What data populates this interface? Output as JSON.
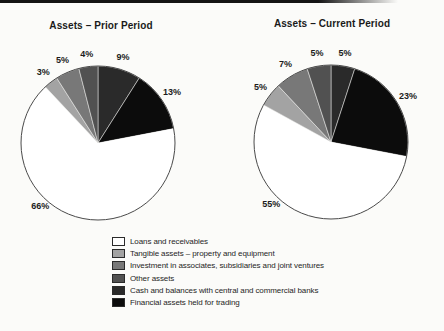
{
  "page": {
    "background": "#fbfbf9",
    "top_rule_color": "#141414"
  },
  "colors": {
    "loans": "#ffffff",
    "tangible": "#a3a3a3",
    "investment": "#787878",
    "other": "#515151",
    "cash": "#2a2a2a",
    "financial": "#0c0c0c",
    "outline": "#4a4a4a",
    "label_text": "#1c1c1c"
  },
  "legend": {
    "items": [
      {
        "key": "loans",
        "label": "Loans and receivables"
      },
      {
        "key": "tangible",
        "label": "Tangible assets – property and equipment"
      },
      {
        "key": "investment",
        "label": "Investment in associates, subsidiaries and joint ventures"
      },
      {
        "key": "other",
        "label": "Other assets"
      },
      {
        "key": "cash",
        "label": "Cash and balances with central and commercial banks"
      },
      {
        "key": "financial",
        "label": "Financial assets held for trading"
      }
    ]
  },
  "chart_data": [
    {
      "type": "pie",
      "title": "Assets – Prior Period",
      "unit": "%",
      "start_angle_deg": 0,
      "direction": "clockwise",
      "legend_position": "bottom-shared",
      "slices": [
        {
          "key": "cash",
          "label": "Cash and balances with central and commercial banks",
          "value": 9
        },
        {
          "key": "financial",
          "label": "Financial assets held for trading",
          "value": 13
        },
        {
          "key": "loans",
          "label": "Loans and receivables",
          "value": 66
        },
        {
          "key": "tangible",
          "label": "Tangible assets – property and equipment",
          "value": 3
        },
        {
          "key": "investment",
          "label": "Investment in associates, subsidiaries and joint ventures",
          "value": 5
        },
        {
          "key": "other",
          "label": "Other assets",
          "value": 4
        }
      ]
    },
    {
      "type": "pie",
      "title": "Assets – Current Period",
      "unit": "%",
      "start_angle_deg": 0,
      "direction": "clockwise",
      "legend_position": "bottom-shared",
      "slices": [
        {
          "key": "cash",
          "label": "Cash and balances with central and commercial banks",
          "value": 5
        },
        {
          "key": "financial",
          "label": "Financial assets held for trading",
          "value": 23
        },
        {
          "key": "loans",
          "label": "Loans and receivables",
          "value": 55
        },
        {
          "key": "tangible",
          "label": "Tangible assets – property and equipment",
          "value": 5
        },
        {
          "key": "investment",
          "label": "Investment in associates, subsidiaries and joint ventures",
          "value": 7
        },
        {
          "key": "other",
          "label": "Other assets",
          "value": 5
        }
      ]
    }
  ]
}
